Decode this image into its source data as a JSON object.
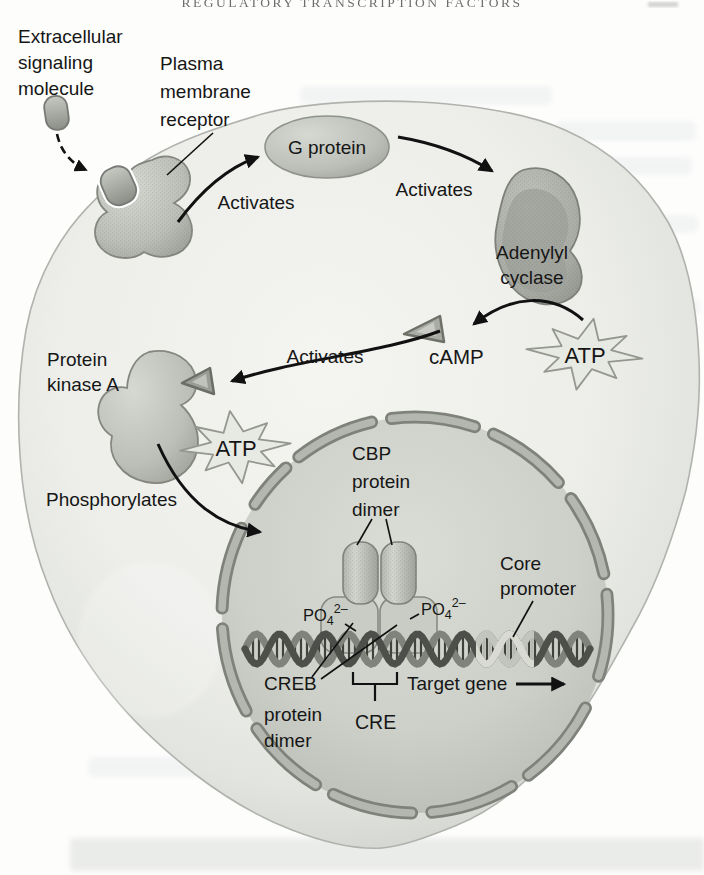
{
  "page": {
    "running_header": "REGULATORY TRANSCRIPTION FACTORS"
  },
  "labels": {
    "extracellular_signaling_molecule": [
      "Extracellular",
      "signaling",
      "molecule"
    ],
    "plasma_membrane_receptor": [
      "Plasma",
      "membrane",
      "receptor"
    ],
    "g_protein": "G protein",
    "activates_receptor_to_g_protein": "Activates",
    "activates_g_protein_to_adenylyl_cyclase": "Activates",
    "activates_camp_to_pka": "Activates",
    "adenylyl_cyclase": [
      "Adenylyl",
      "cyclase"
    ],
    "camp": "cAMP",
    "atp_near_adenylyl_cyclase": "ATP",
    "atp_near_protein_kinase_a": "ATP",
    "protein_kinase_a": [
      "Protein",
      "kinase A"
    ],
    "phosphorylates": "Phosphorylates",
    "cbp_protein_dimer": [
      "CBP",
      "protein",
      "dimer"
    ],
    "po4_left": {
      "base": "PO",
      "subscript": "4",
      "superscript": "2–"
    },
    "po4_right": {
      "base": "PO",
      "subscript": "4",
      "superscript": "2–"
    },
    "creb_protein_dimer": [
      "CREB",
      "protein",
      "dimer"
    ],
    "cre": "CRE",
    "target_gene": "Target gene",
    "core_promoter": [
      "Core",
      "promoter"
    ]
  },
  "colors": {
    "text": "#161616",
    "cell_fill_center": "#f3f4f0",
    "cell_fill_edge": "#c6c9c3",
    "cell_outline": "#b0b3ad",
    "nucleus_fill_center": "#d8dad4",
    "nucleus_fill_edge": "#bbbeb7",
    "envelope_dark": "#7f827b",
    "envelope_light": "#b4b7b0",
    "protein_fill": "#bcbfb8",
    "protein_outline": "#84877f",
    "dna_dark": "#4d504a",
    "dna_mid": "#80837b",
    "dna_rung": "#3f423b",
    "dna_light_strand_a": "#d9dbd3",
    "dna_light_strand_b": "#c2c5bd",
    "dna_light_rung": "#b6b9b1",
    "star_fill": "#e7e9e3"
  }
}
